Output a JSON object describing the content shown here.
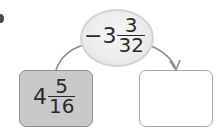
{
  "diagram": {
    "operation": {
      "sign": "−",
      "whole": "3",
      "numerator": "3",
      "denominator": "32"
    },
    "input_box": {
      "whole": "4",
      "numerator": "5",
      "denominator": "16"
    },
    "output_box": {
      "value": ""
    },
    "colors": {
      "ellipse_fill": "#ececec",
      "input_fill": "#c9c9c9",
      "output_fill": "#ffffff",
      "stroke": "#8c8c8c",
      "text": "#2b2b2b"
    }
  }
}
